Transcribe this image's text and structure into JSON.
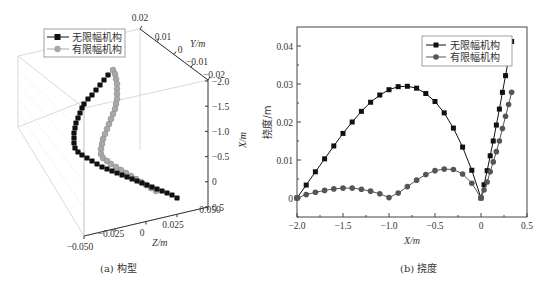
{
  "figure": {
    "panel_a": {
      "caption": "(a) 构型"
    },
    "panel_b": {
      "caption": "(b) 挠度"
    }
  },
  "chart_data": [
    {
      "id": "a",
      "type": "scatter",
      "subtype": "3d-scatter",
      "title": "(a) 构型",
      "axes": {
        "X": {
          "label": "X/m",
          "ticks": [
            "-2.0",
            "-1.5",
            "-1.0",
            "-0.5",
            "0",
            "0.5"
          ],
          "range": [
            -2.0,
            0.5
          ]
        },
        "Y": {
          "label": "Y/m",
          "ticks": [
            "0.02",
            "0.01",
            "0",
            "-0.01",
            "-0.02"
          ],
          "range": [
            -0.02,
            0.02
          ]
        },
        "Z": {
          "label": "Z/m",
          "ticks": [
            "-0.050",
            "-0.025",
            "0",
            "0.025",
            "0.050"
          ],
          "range": [
            -0.05,
            0.05
          ]
        }
      },
      "legend": [
        {
          "label": "无限幅机构",
          "marker": "square",
          "color": "#111111"
        },
        {
          "label": "有限幅机构",
          "marker": "circle",
          "color": "#a8a8a8"
        }
      ],
      "grid": true
    },
    {
      "id": "b",
      "type": "line",
      "title": "(b) 挠度",
      "xlabel": "X/m",
      "ylabel": "挠度/m",
      "xlim": [
        -2.0,
        0.5
      ],
      "ylim": [
        -0.005,
        0.045
      ],
      "xticks": [
        "-2.0",
        "-1.5",
        "-1.0",
        "-0.5",
        "0",
        "0.5"
      ],
      "yticks": [
        "0",
        "0.01",
        "0.02",
        "0.03",
        "0.04"
      ],
      "legend_position": "upper right",
      "grid": false,
      "series": [
        {
          "name": "无限幅机构",
          "marker": "square",
          "color": "#111111",
          "x": [
            -2.0,
            -1.9,
            -1.8,
            -1.7,
            -1.6,
            -1.5,
            -1.4,
            -1.3,
            -1.2,
            -1.1,
            -1.0,
            -0.9,
            -0.8,
            -0.7,
            -0.6,
            -0.5,
            -0.4,
            -0.3,
            -0.2,
            -0.1,
            0.0,
            0.033,
            0.067,
            0.1,
            0.133,
            0.167,
            0.2,
            0.233,
            0.267,
            0.3,
            0.333
          ],
          "y": [
            0,
            0.0034,
            0.0069,
            0.0103,
            0.0137,
            0.017,
            0.02,
            0.0228,
            0.0252,
            0.0271,
            0.0285,
            0.0293,
            0.0294,
            0.0289,
            0.0275,
            0.0254,
            0.0224,
            0.0184,
            0.0134,
            0.0073,
            0,
            0.0035,
            0.0072,
            0.0111,
            0.015,
            0.0192,
            0.0234,
            0.0278,
            0.0322,
            0.0367,
            0.0412
          ]
        },
        {
          "name": "有限幅机构",
          "marker": "circle",
          "color": "#555555",
          "x": [
            -2.0,
            -1.9,
            -1.8,
            -1.7,
            -1.6,
            -1.5,
            -1.4,
            -1.3,
            -1.2,
            -1.1,
            -1.0,
            -0.9,
            -0.8,
            -0.7,
            -0.6,
            -0.5,
            -0.4,
            -0.3,
            -0.2,
            -0.1,
            0.0,
            0.033,
            0.067,
            0.1,
            0.133,
            0.167,
            0.2,
            0.233,
            0.267,
            0.3,
            0.333
          ],
          "y": [
            0,
            0.0009,
            0.0015,
            0.002,
            0.0024,
            0.0026,
            0.0026,
            0.0023,
            0.0018,
            0.0011,
            0.0001,
            0.0013,
            0.003,
            0.0047,
            0.0062,
            0.0072,
            0.0076,
            0.0075,
            0.0063,
            0.0039,
            0,
            0.0021,
            0.0042,
            0.0069,
            0.0095,
            0.0122,
            0.015,
            0.0183,
            0.0215,
            0.0246,
            0.0278
          ]
        }
      ]
    }
  ]
}
